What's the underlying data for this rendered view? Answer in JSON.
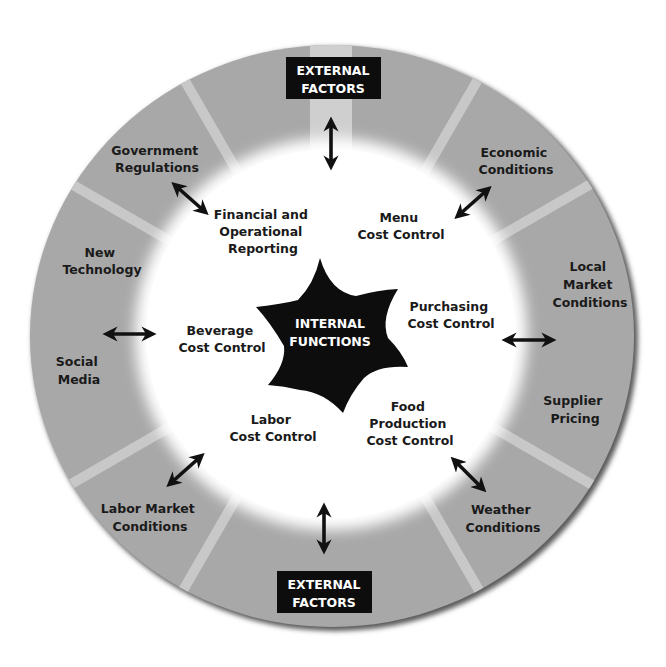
{
  "colors": {
    "ring": "#a8a8a8",
    "spoke": "#c9c9c9",
    "rim": "#6e6e6e",
    "inner": "#ffffff",
    "star": "#0d0d0d",
    "box": "#0d0d0d",
    "text": "#1a1a1a"
  },
  "center": {
    "line1": "INTERNAL",
    "line2": "FUNCTIONS"
  },
  "external_boxes": {
    "top": {
      "line1": "EXTERNAL",
      "line2": "FACTORS"
    },
    "bottom": {
      "line1": "EXTERNAL",
      "line2": "FACTORS"
    }
  },
  "external_factors": [
    {
      "id": "government-regulations",
      "lines": [
        "Government",
        "Regulations"
      ]
    },
    {
      "id": "economic-conditions",
      "lines": [
        "Economic",
        "Conditions"
      ]
    },
    {
      "id": "new-technology",
      "lines": [
        "New",
        "Technology"
      ]
    },
    {
      "id": "local-market-conditions",
      "lines": [
        "Local",
        "Market",
        "Conditions"
      ]
    },
    {
      "id": "social-media",
      "lines": [
        "Social",
        "Media"
      ]
    },
    {
      "id": "supplier-pricing",
      "lines": [
        "Supplier",
        "Pricing"
      ]
    },
    {
      "id": "labor-market-conditions",
      "lines": [
        "Labor Market",
        "Conditions"
      ]
    },
    {
      "id": "weather-conditions",
      "lines": [
        "Weather",
        "Conditions"
      ]
    }
  ],
  "internal_functions": [
    {
      "id": "financial-operational-reporting",
      "lines": [
        "Financial and",
        "Operational",
        "Reporting"
      ]
    },
    {
      "id": "menu-cost-control",
      "lines": [
        "Menu",
        "Cost Control"
      ]
    },
    {
      "id": "purchasing-cost-control",
      "lines": [
        "Purchasing",
        "Cost Control"
      ]
    },
    {
      "id": "beverage-cost-control",
      "lines": [
        "Beverage",
        "Cost Control"
      ]
    },
    {
      "id": "labor-cost-control",
      "lines": [
        "Labor",
        "Cost Control"
      ]
    },
    {
      "id": "food-production-cost-control",
      "lines": [
        "Food",
        "Production",
        "Cost Control"
      ]
    }
  ]
}
